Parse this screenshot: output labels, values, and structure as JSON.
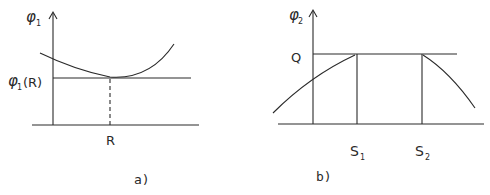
{
  "panel_a": {
    "y_axis_label": "φ",
    "y_axis_sub": "1",
    "level_label": "φ",
    "level_sub": "1",
    "level_arg": "(R)",
    "x_point_label": "R",
    "caption": "a)"
  },
  "panel_b": {
    "y_axis_label": "φ",
    "y_axis_sub": "2",
    "level_label": "Q",
    "s1_label": "S",
    "s1_sub": "1",
    "s2_label": "S",
    "s2_sub": "2",
    "caption": "b)"
  },
  "colors": {
    "stroke": "#2a2a2a",
    "background": "#ffffff"
  }
}
